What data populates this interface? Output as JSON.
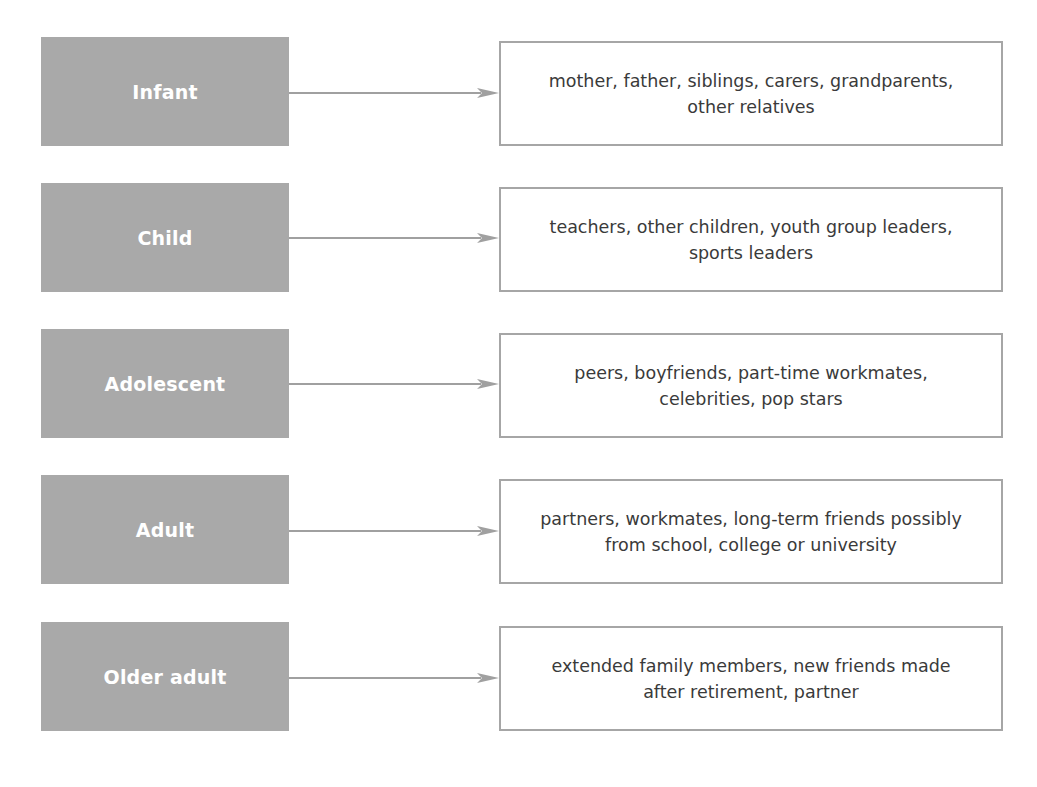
{
  "diagram": {
    "colors": {
      "stage_fill": "#a9a9a9",
      "stage_text": "#ffffff",
      "arrow": "#a0a0a0",
      "box_border": "#a6a6a6",
      "box_text": "#3a3a3a"
    },
    "rows": [
      {
        "stage": "Infant",
        "influences_line1": "mother, father, siblings, carers, grandparents,",
        "influences_line2": "other relatives"
      },
      {
        "stage": "Child",
        "influences_line1": "teachers, other children, youth group leaders,",
        "influences_line2": "sports leaders"
      },
      {
        "stage": "Adolescent",
        "influences_line1": "peers, boyfriends, part-time workmates,",
        "influences_line2": "celebrities, pop stars"
      },
      {
        "stage": "Adult",
        "influences_line1": "partners, workmates, long-term friends possibly",
        "influences_line2": "from school, college or university"
      },
      {
        "stage": "Older adult",
        "influences_line1": "extended family members, new friends made",
        "influences_line2": "after retirement, partner"
      }
    ]
  }
}
